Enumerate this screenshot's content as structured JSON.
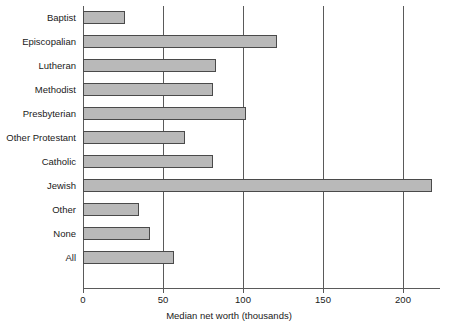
{
  "chart_data": {
    "type": "bar",
    "orientation": "horizontal",
    "title": "",
    "xlabel": "Median net worth (thousands)",
    "ylabel": "",
    "xlim": [
      0,
      225
    ],
    "xticks": [
      0,
      50,
      100,
      150,
      200
    ],
    "xtick_labels": [
      "0",
      "50",
      "100",
      "150",
      "200"
    ],
    "grid": "vertical gridlines at 50, 100, 150, 200",
    "legend": "none",
    "bar_fill_color": "#b9b9b9",
    "bar_edge_color": "#4a4a4a",
    "axis_color": "#5a5a5a",
    "categories": [
      "Baptist",
      "Episcopalian",
      "Lutheran",
      "Methodist",
      "Presbyterian",
      "Other Protestant",
      "Catholic",
      "Jewish",
      "Other",
      "None",
      "All"
    ],
    "values": [
      26,
      121,
      83,
      81,
      102,
      64,
      81,
      218,
      35,
      42,
      57
    ]
  }
}
